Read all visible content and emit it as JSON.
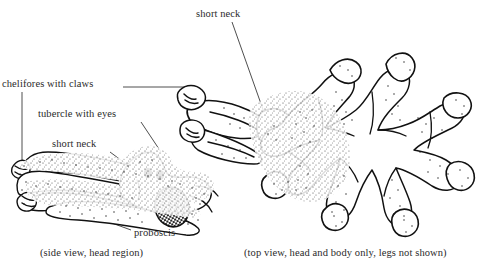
{
  "figure": {
    "background_color": "#ffffff",
    "ink_color": "#111111",
    "label_color": "#2a2a2a",
    "width": 491,
    "height": 265
  },
  "labels": {
    "chelifores": "chelifores with claws",
    "tubercle": "tubercle with eyes",
    "short_neck_side": "short neck",
    "proboscis": "proboscis",
    "short_neck_top": "short neck"
  },
  "captions": {
    "side_view": "(side view, head region)",
    "top_view": "(top view, head and body only, legs not shown)"
  },
  "cut_off_text_top": "",
  "panels": [
    {
      "id": "side-view",
      "name": "side view of head region",
      "caption": "(side view, head region)",
      "annotations": [
        "chelifores with claws",
        "tubercle with eyes",
        "short neck",
        "proboscis"
      ]
    },
    {
      "id": "top-view",
      "name": "top view of head and body",
      "caption": "(top view, head and body only, legs not shown)",
      "annotations": [
        "short neck"
      ]
    }
  ]
}
